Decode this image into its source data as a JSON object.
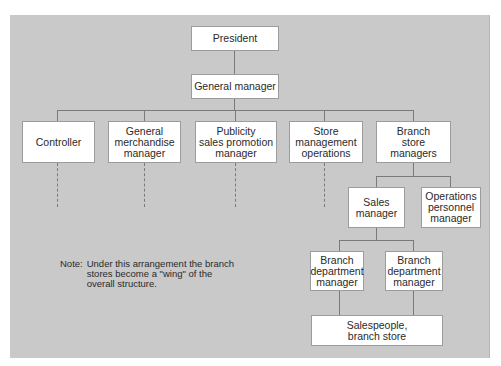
{
  "diagram": {
    "type": "organization-chart",
    "background_color": "#c9c9c9",
    "nodes": {
      "president": "President",
      "general_manager": "General manager",
      "controller": "Controller",
      "general_merchandise_manager": "General\nmerchandise\nmanager",
      "publicity_sales_promotion_manager": "Publicity\nsales promotion\nmanager",
      "store_management_operations": "Store\nmanagement\noperations",
      "branch_store_managers": "Branch\nstore\nmanagers",
      "sales_manager": "Sales\nmanager",
      "operations_personnel_manager": "Operations\npersonnel\nmanager",
      "branch_department_manager_1": "Branch\ndepartment\nmanager",
      "branch_department_manager_2": "Branch\ndepartment\nmanager",
      "salespeople_branch_store": "Salespeople,\nbranch store"
    },
    "edges": [
      [
        "president",
        "general_manager"
      ],
      [
        "general_manager",
        "controller"
      ],
      [
        "general_manager",
        "general_merchandise_manager"
      ],
      [
        "general_manager",
        "publicity_sales_promotion_manager"
      ],
      [
        "general_manager",
        "store_management_operations"
      ],
      [
        "general_manager",
        "branch_store_managers"
      ],
      [
        "branch_store_managers",
        "sales_manager"
      ],
      [
        "branch_store_managers",
        "operations_personnel_manager"
      ],
      [
        "sales_manager",
        "branch_department_manager_1"
      ],
      [
        "sales_manager",
        "branch_department_manager_2"
      ],
      [
        "branch_department_manager_1",
        "salespeople_branch_store"
      ],
      [
        "branch_department_manager_2",
        "salespeople_branch_store"
      ]
    ],
    "note": {
      "label": "Note:",
      "text": "Under this arrangement the branch\nstores become  a \"wing\" of the\noverall structure."
    }
  }
}
